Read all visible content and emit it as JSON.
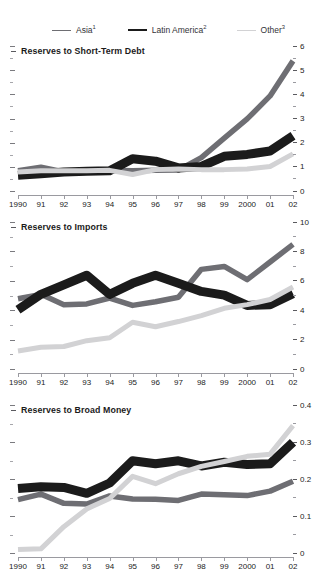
{
  "clipped_header": "————————————",
  "legend": {
    "items": [
      {
        "label": "Asia",
        "sup": "1",
        "color": "#6e6e73",
        "key": "asia"
      },
      {
        "label": "Latin America",
        "sup": "2",
        "color": "#1b1b1b",
        "key": "latin_america"
      },
      {
        "label": "Other",
        "sup": "3",
        "color": "#d2d2d4",
        "key": "other"
      }
    ]
  },
  "chart_data": [
    {
      "type": "line",
      "title": "Reserves to Short-Term Debt",
      "xlabel": "",
      "ylabel": "",
      "ylim": [
        0,
        6
      ],
      "yticks": [
        0,
        1,
        2,
        3,
        4,
        5,
        6
      ],
      "ytick_labels": [
        "0",
        "1",
        "2",
        "3",
        "4",
        "5",
        "6"
      ],
      "minor_ticks": true,
      "grid": false,
      "legend_position": "top",
      "axis_side": "right",
      "categories": [
        "1990",
        "91",
        "92",
        "93",
        "94",
        "95",
        "96",
        "97",
        "98",
        "99",
        "2000",
        "01",
        "02"
      ],
      "series": [
        {
          "name": "Asia",
          "color": "#6e6e73",
          "values": [
            1.0,
            1.15,
            0.95,
            0.98,
            1.02,
            1.0,
            1.02,
            1.03,
            1.55,
            2.35,
            3.15,
            4.1,
            5.55
          ]
        },
        {
          "name": "Latin America",
          "color": "#1b1b1b",
          "values": [
            0.82,
            0.88,
            0.95,
            0.98,
            1.0,
            1.5,
            1.4,
            1.12,
            1.18,
            1.6,
            1.68,
            1.82,
            2.45
          ]
        },
        {
          "name": "Other",
          "color": "#d2d2d4",
          "values": [
            0.95,
            1.0,
            1.0,
            1.0,
            1.02,
            0.85,
            1.05,
            1.08,
            1.05,
            1.05,
            1.08,
            1.18,
            1.7
          ]
        }
      ]
    },
    {
      "type": "line",
      "title": "Reserves to Imports",
      "xlabel": "",
      "ylabel": "",
      "ylim": [
        0,
        10
      ],
      "yticks": [
        0,
        2,
        4,
        6,
        8,
        10
      ],
      "ytick_labels": [
        "0",
        "2",
        "4",
        "6",
        "8",
        "10"
      ],
      "minor_ticks": true,
      "grid": false,
      "legend_position": "top",
      "axis_side": "right",
      "categories": [
        "1990",
        "91",
        "92",
        "93",
        "94",
        "95",
        "96",
        "97",
        "98",
        "99",
        "2000",
        "01",
        "02"
      ],
      "series": [
        {
          "name": "Asia",
          "color": "#6e6e73",
          "values": [
            5.05,
            5.35,
            4.65,
            4.7,
            5.1,
            4.6,
            4.85,
            5.15,
            7.05,
            7.25,
            6.35,
            7.55,
            8.75
          ]
        },
        {
          "name": "Latin America",
          "color": "#1b1b1b",
          "values": [
            4.3,
            5.35,
            6.0,
            6.65,
            5.35,
            6.1,
            6.65,
            6.1,
            5.55,
            5.3,
            4.6,
            4.65,
            5.4
          ]
        },
        {
          "name": "Other",
          "color": "#d2d2d4",
          "values": [
            1.5,
            1.75,
            1.8,
            2.2,
            2.4,
            3.45,
            3.15,
            3.5,
            3.9,
            4.4,
            4.65,
            5.0,
            5.85
          ]
        }
      ]
    },
    {
      "type": "line",
      "title": "Reserves to Broad Money",
      "xlabel": "",
      "ylabel": "",
      "ylim": [
        0,
        0.4
      ],
      "yticks": [
        0,
        0.1,
        0.2,
        0.3,
        0.4
      ],
      "ytick_labels": [
        "0",
        "0.1",
        "0.2",
        "0.3",
        "0.4"
      ],
      "minor_ticks": true,
      "grid": false,
      "legend_position": "top",
      "axis_side": "right",
      "categories": [
        "1990",
        "91",
        "92",
        "93",
        "94",
        "95",
        "96",
        "97",
        "98",
        "99",
        "2000",
        "01",
        "02"
      ],
      "series": [
        {
          "name": "Asia",
          "color": "#6e6e73",
          "values": [
            0.155,
            0.17,
            0.145,
            0.143,
            0.165,
            0.157,
            0.156,
            0.153,
            0.17,
            0.168,
            0.166,
            0.178,
            0.205
          ]
        },
        {
          "name": "Latin America",
          "color": "#1b1b1b",
          "values": [
            0.185,
            0.19,
            0.188,
            0.172,
            0.2,
            0.26,
            0.252,
            0.26,
            0.246,
            0.256,
            0.25,
            0.252,
            0.31
          ]
        },
        {
          "name": "Other",
          "color": "#d2d2d4",
          "values": [
            0.02,
            0.022,
            0.082,
            0.13,
            0.158,
            0.218,
            0.198,
            0.225,
            0.245,
            0.258,
            0.272,
            0.278,
            0.355
          ]
        }
      ]
    }
  ]
}
